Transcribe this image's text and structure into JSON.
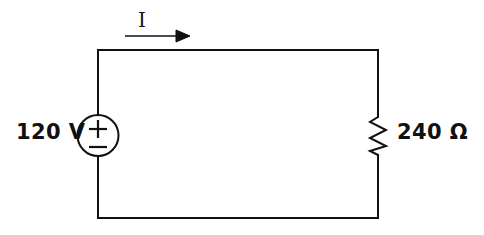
{
  "figure": {
    "type": "circuit-schematic",
    "background_color": "#ffffff",
    "line_color": "#111111",
    "line_width_px": 2
  },
  "labels": {
    "source_value": "120 V",
    "resistor_value": "240 Ω",
    "current": "I",
    "polarity_positive": "+",
    "polarity_negative": "−"
  },
  "components": {
    "voltage_source": {
      "name": "voltage-source",
      "symbol": "circle-plus-minus",
      "value": "120 V",
      "magnitude": 120,
      "unit": "V",
      "position": "left-branch",
      "center_x": 98,
      "center_y": 135,
      "radius": 20
    },
    "resistor": {
      "name": "resistor",
      "symbol": "zigzag",
      "value": "240 Ω",
      "magnitude": 240,
      "unit": "Ω",
      "position": "right-branch",
      "center_x": 378,
      "center_y": 136
    },
    "current_arrow": {
      "name": "current-arrow",
      "label": "I",
      "direction": "right",
      "position": "above-top-wire"
    }
  },
  "loop": {
    "left_x": 98,
    "right_x": 378,
    "top_y": 50,
    "bottom_y": 218
  }
}
